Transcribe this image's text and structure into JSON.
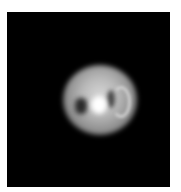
{
  "image": {
    "description": "Grayscale image of a bright round object on a black background",
    "colors": {
      "background": "#000000",
      "page": "#ffffff",
      "object_highlight": "#ffffff",
      "object_body": "#b8b8b8",
      "object_shadow": "#2a2a2a"
    }
  }
}
